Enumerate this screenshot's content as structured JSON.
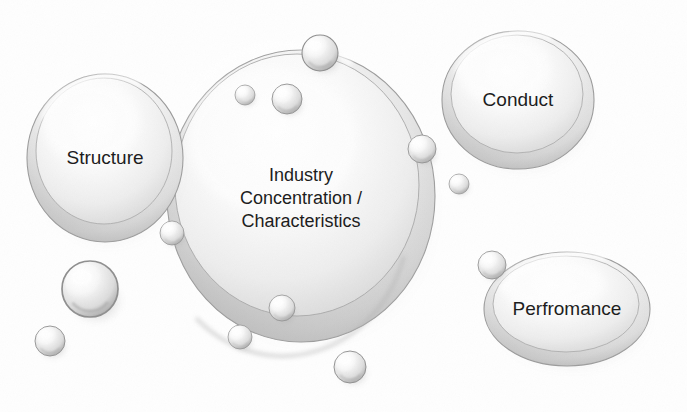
{
  "diagram": {
    "background_color": "#fefefe",
    "ink_color": "#1b1b1b",
    "bubble_fill_light": "#fdfdfd",
    "bubble_fill_mid": "#e2e2e2",
    "bubble_fill_shadow": "#b9b9b9",
    "bubble_outline": "#8f8f8f"
  },
  "bubbles": {
    "structure": {
      "label": "Structure",
      "cx": 105,
      "cy": 158,
      "rx": 78,
      "ry": 84,
      "font_size": 19
    },
    "center": {
      "label_lines": [
        "Industry",
        "Concentration /",
        "Characteristics"
      ],
      "cx": 301,
      "cy": 196,
      "rx": 134,
      "ry": 146,
      "font_size": 18,
      "line_height": 23
    },
    "conduct": {
      "label": "Conduct",
      "cx": 518,
      "cy": 100,
      "rx": 76,
      "ry": 69,
      "font_size": 19
    },
    "performance": {
      "label": "Perfromance",
      "cx": 567,
      "cy": 309,
      "rx": 83,
      "ry": 57,
      "font_size": 19
    }
  },
  "droplets": [
    {
      "name": "droplet-top-rim",
      "cx": 320,
      "cy": 53,
      "r": 18
    },
    {
      "name": "droplet-top-inner-small",
      "cx": 245,
      "cy": 95,
      "r": 10
    },
    {
      "name": "droplet-top-inner-big",
      "cx": 287,
      "cy": 99,
      "r": 15
    },
    {
      "name": "droplet-right-upper",
      "cx": 422,
      "cy": 149,
      "r": 14
    },
    {
      "name": "droplet-right-lower",
      "cx": 459,
      "cy": 184,
      "r": 10
    },
    {
      "name": "droplet-left-rim",
      "cx": 172,
      "cy": 233,
      "r": 12
    },
    {
      "name": "droplet-inner-bottom",
      "cx": 282,
      "cy": 308,
      "r": 13
    },
    {
      "name": "droplet-bottom-rim",
      "cx": 240,
      "cy": 337,
      "r": 12
    },
    {
      "name": "droplet-below-center",
      "cx": 350,
      "cy": 367,
      "r": 16
    },
    {
      "name": "droplet-lower-left-big",
      "cx": 90,
      "cy": 289,
      "r": 28
    },
    {
      "name": "droplet-lower-left-tiny",
      "cx": 50,
      "cy": 341,
      "r": 15
    },
    {
      "name": "droplet-performance-rim",
      "cx": 492,
      "cy": 265,
      "r": 14
    }
  ]
}
